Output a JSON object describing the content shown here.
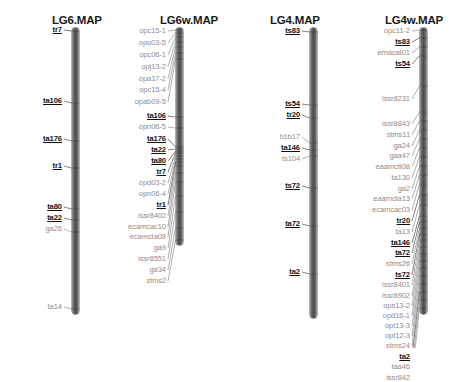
{
  "figure": {
    "background": "#ffffff",
    "common_marker_color": "#111111",
    "unique_marker_color": "#8e8e8e",
    "bar_color": "#4c4c4c",
    "leader_color": "#8e8e8e"
  },
  "maps": [
    {
      "id": "lg6",
      "title": "LG6.MAP",
      "title_x": 52,
      "title_y": 14,
      "bar_x": 72,
      "bar_y": 28,
      "bar_w": 7,
      "bar_h": 286,
      "label_right": 62,
      "markers": [
        {
          "name": "tr7",
          "style": "common",
          "label_y": 30,
          "locus_y": 31
        },
        {
          "name": "ta106",
          "style": "common",
          "label_y": 101,
          "locus_y": 103
        },
        {
          "name": "ta176",
          "style": "common",
          "label_y": 139,
          "locus_y": 141
        },
        {
          "name": "tr1",
          "style": "common",
          "label_y": 166,
          "locus_y": 168
        },
        {
          "name": "ta80",
          "style": "common",
          "label_y": 207,
          "locus_y": 209
        },
        {
          "name": "ta22",
          "style": "common",
          "label_y": 218,
          "locus_y": 220
        },
        {
          "name": "ga26",
          "style": "unique",
          "label_y": 229,
          "locus_y": 232
        },
        {
          "name": "ta14",
          "style": "unique",
          "label_y": 307,
          "locus_y": 309
        }
      ]
    },
    {
      "id": "lg6w",
      "title": "LG6w.MAP",
      "title_x": 160,
      "title_y": 14,
      "bar_x": 176,
      "bar_y": 28,
      "bar_w": 7,
      "bar_h": 217,
      "label_right": 166,
      "markers": [
        {
          "name": "opc15-1",
          "style": "unique",
          "label_y": 31,
          "locus_y": 30
        },
        {
          "name": "opu03-5",
          "style": "unique",
          "label_y": 43,
          "locus_y": 33
        },
        {
          "name": "opc06-1",
          "style": "unique",
          "label_y": 55,
          "locus_y": 37
        },
        {
          "name": "opj13-2",
          "style": "unique",
          "label_y": 67,
          "locus_y": 42
        },
        {
          "name": "opa17-2",
          "style": "unique",
          "label_y": 79,
          "locus_y": 47
        },
        {
          "name": "opc15-4",
          "style": "unique",
          "label_y": 90,
          "locus_y": 53
        },
        {
          "name": "opab09-5",
          "style": "unique",
          "label_y": 102,
          "locus_y": 59
        },
        {
          "name": "ta106",
          "style": "common",
          "label_y": 116,
          "locus_y": 117
        },
        {
          "name": "opn06-5",
          "style": "unique",
          "label_y": 127,
          "locus_y": 128
        },
        {
          "name": "ta176",
          "style": "common",
          "label_y": 139,
          "locus_y": 147
        },
        {
          "name": "ta22",
          "style": "common",
          "label_y": 150,
          "locus_y": 149
        },
        {
          "name": "ta80",
          "style": "common",
          "label_y": 161,
          "locus_y": 151
        },
        {
          "name": "tr7",
          "style": "common",
          "label_y": 172,
          "locus_y": 153
        },
        {
          "name": "opd03-2",
          "style": "unique",
          "label_y": 183,
          "locus_y": 156
        },
        {
          "name": "opn06-4",
          "style": "unique",
          "label_y": 194,
          "locus_y": 159
        },
        {
          "name": "tr1",
          "style": "common",
          "label_y": 205,
          "locus_y": 162
        },
        {
          "name": "issr8402",
          "style": "unique",
          "label_y": 216,
          "locus_y": 166
        },
        {
          "name": "ecamcac10",
          "style": "unique",
          "label_y": 227,
          "locus_y": 173
        },
        {
          "name": "ecamcta08",
          "style": "unique",
          "label_y": 237,
          "locus_y": 182
        },
        {
          "name": "ga9",
          "style": "unique",
          "label_y": 248,
          "locus_y": 196
        },
        {
          "name": "issr8551",
          "style": "unique",
          "label_y": 259,
          "locus_y": 212
        },
        {
          "name": "ga34",
          "style": "unique",
          "label_y": 270,
          "locus_y": 228
        },
        {
          "name": "stms2",
          "style": "unique",
          "label_y": 281,
          "locus_y": 240
        }
      ]
    },
    {
      "id": "lg4",
      "title": "LG4.MAP",
      "title_x": 270,
      "title_y": 14,
      "bar_x": 310,
      "bar_y": 28,
      "bar_w": 7,
      "bar_h": 290,
      "label_right": 300,
      "markers": [
        {
          "name": "ts83",
          "style": "common",
          "label_y": 31,
          "locus_y": 32
        },
        {
          "name": "ts54",
          "style": "common",
          "label_y": 104,
          "locus_y": 105
        },
        {
          "name": "tr20",
          "style": "common",
          "label_y": 115,
          "locus_y": 118
        },
        {
          "name": "h1b17",
          "style": "unique",
          "label_y": 137,
          "locus_y": 143
        },
        {
          "name": "ta146",
          "style": "common",
          "label_y": 148,
          "locus_y": 150
        },
        {
          "name": "ts104",
          "style": "unique",
          "label_y": 159,
          "locus_y": 156
        },
        {
          "name": "ts72",
          "style": "common",
          "label_y": 186,
          "locus_y": 188
        },
        {
          "name": "ta72",
          "style": "common",
          "label_y": 224,
          "locus_y": 226
        },
        {
          "name": "ta2",
          "style": "common",
          "label_y": 272,
          "locus_y": 274
        }
      ]
    },
    {
      "id": "lg4w",
      "title": "LG4w.MAP",
      "title_x": 385,
      "title_y": 14,
      "bar_x": 420,
      "bar_y": 28,
      "bar_w": 7,
      "bar_h": 286,
      "label_right": 410,
      "markers": [
        {
          "name": "opc11-2",
          "style": "unique",
          "label_y": 31,
          "locus_y": 30
        },
        {
          "name": "ts83",
          "style": "common",
          "label_y": 42,
          "locus_y": 38
        },
        {
          "name": "emacat01",
          "style": "unique",
          "label_y": 53,
          "locus_y": 47
        },
        {
          "name": "ts54",
          "style": "common",
          "label_y": 64,
          "locus_y": 56
        },
        {
          "name": "issr8231",
          "style": "unique",
          "label_y": 99,
          "locus_y": 86
        },
        {
          "name": "issr8843",
          "style": "unique",
          "label_y": 124,
          "locus_y": 112
        },
        {
          "name": "stms11",
          "style": "unique",
          "label_y": 135,
          "locus_y": 121
        },
        {
          "name": "ga24",
          "style": "unique",
          "label_y": 146,
          "locus_y": 130
        },
        {
          "name": "gaa47",
          "style": "unique",
          "label_y": 156,
          "locus_y": 139
        },
        {
          "name": "eaamctt08",
          "style": "unique",
          "label_y": 167,
          "locus_y": 148
        },
        {
          "name": "ta130",
          "style": "unique",
          "label_y": 178,
          "locus_y": 157
        },
        {
          "name": "ga2",
          "style": "unique",
          "label_y": 189,
          "locus_y": 166
        },
        {
          "name": "eaamcta13",
          "style": "unique",
          "label_y": 199,
          "locus_y": 175
        },
        {
          "name": "ecamcac03",
          "style": "unique",
          "label_y": 210,
          "locus_y": 184
        },
        {
          "name": "tr20",
          "style": "common",
          "label_y": 221,
          "locus_y": 195
        },
        {
          "name": "ta13",
          "style": "unique",
          "label_y": 232,
          "locus_y": 205
        },
        {
          "name": "ta146",
          "style": "common",
          "label_y": 243,
          "locus_y": 216
        },
        {
          "name": "ta72",
          "style": "common",
          "label_y": 253,
          "locus_y": 222
        },
        {
          "name": "stms26",
          "style": "unique",
          "label_y": 264,
          "locus_y": 228
        },
        {
          "name": "ts72",
          "style": "common",
          "label_y": 275,
          "locus_y": 234
        },
        {
          "name": "issr8401",
          "style": "unique",
          "label_y": 285,
          "locus_y": 240
        },
        {
          "name": "issr8902",
          "style": "unique",
          "label_y": 296,
          "locus_y": 247
        },
        {
          "name": "ops13-2",
          "style": "unique",
          "label_y": 306,
          "locus_y": 254
        },
        {
          "name": "opd16-1",
          "style": "unique",
          "label_y": 316,
          "locus_y": 261
        },
        {
          "name": "opt13-3",
          "style": "unique",
          "label_y": 326,
          "locus_y": 268
        },
        {
          "name": "opt12-3",
          "style": "unique",
          "label_y": 336,
          "locus_y": 276
        },
        {
          "name": "stms24",
          "style": "unique",
          "label_y": 346,
          "locus_y": 284
        },
        {
          "name": "ta2",
          "style": "common",
          "label_y": 357,
          "locus_y": 292
        },
        {
          "name": "taa46",
          "style": "unique",
          "label_y": 367,
          "locus_y": 300
        },
        {
          "name": "issr842",
          "style": "unique",
          "label_y": 378,
          "locus_y": 308
        }
      ]
    }
  ]
}
